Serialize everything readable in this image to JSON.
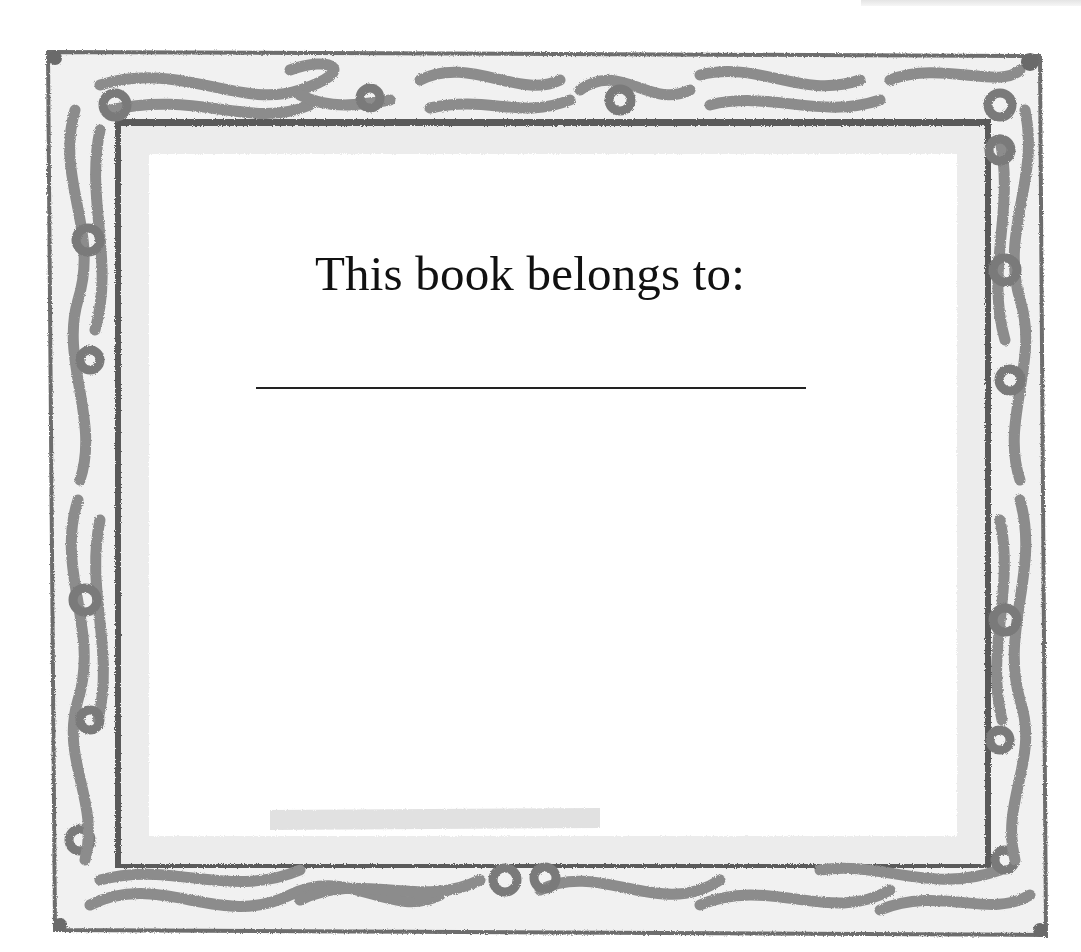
{
  "bookplate": {
    "title": "This book belongs to:",
    "owner_name": "",
    "colors": {
      "frame_dark": "#555555",
      "frame_mid": "#8a8a8a",
      "frame_light": "#b5b5b5",
      "paper": "#ffffff",
      "text": "#111111"
    }
  }
}
